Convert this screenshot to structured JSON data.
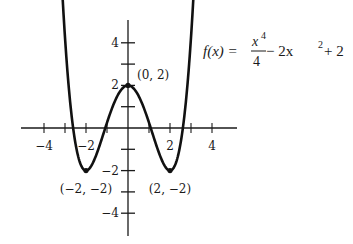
{
  "chart_data": {
    "type": "line",
    "title": "",
    "function_label": {
      "lhs": "f(x) = ",
      "frac_num": "x",
      "frac_num_exp": "4",
      "frac_den": "4",
      "rest": " − 2x",
      "rest_exp": "2",
      "tail": " + 2"
    },
    "xlabel": "",
    "ylabel": "",
    "xlim": [
      -5,
      5.2
    ],
    "ylim": [
      -5.2,
      5.2
    ],
    "x_ticks": [
      -4,
      -3,
      -2,
      -1,
      1,
      2,
      3,
      4
    ],
    "x_tick_labels": [
      {
        "value": -4,
        "label": "−4"
      },
      {
        "value": -2,
        "label": "−2"
      },
      {
        "value": 2,
        "label": "2"
      },
      {
        "value": 4,
        "label": "4"
      }
    ],
    "y_ticks": [
      -4,
      -3,
      -2,
      -1,
      1,
      2,
      3,
      4
    ],
    "y_tick_labels": [
      {
        "value": 4,
        "label": "4"
      },
      {
        "value": 2,
        "label": "2"
      },
      {
        "value": -2,
        "label": "−2"
      },
      {
        "value": -4,
        "label": "−4"
      }
    ],
    "series": [
      {
        "name": "f(x) = x^4/4 - 2x^2 + 2",
        "x_range": [
          -3.12,
          3.12
        ],
        "formula": "x^4/4 - 2*x^2 + 2"
      }
    ],
    "points": [
      {
        "x": 0,
        "y": 2,
        "label": "(0, 2)",
        "label_pos": "upper-right"
      },
      {
        "x": -2,
        "y": -2,
        "label": "(−2, −2)",
        "label_pos": "below"
      },
      {
        "x": 2,
        "y": -2,
        "label": "(2, −2)",
        "label_pos": "below"
      }
    ],
    "grid": false,
    "legend": "none"
  }
}
